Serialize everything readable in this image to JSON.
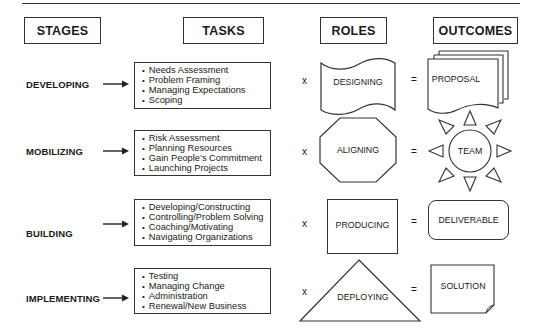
{
  "headers": {
    "stages": "STAGES",
    "tasks": "TASKS",
    "roles": "ROLES",
    "outcomes": "OUTCOMES"
  },
  "rows": [
    {
      "stage": "DEVELOPING",
      "tasks": [
        "Needs Assessment",
        "Problem Framing",
        "Managing Expectations",
        "Scoping"
      ],
      "operator_times": "x",
      "role": "DESIGNING",
      "role_shape": "banner-icon",
      "operator_equals": "=",
      "outcome": "PROPOSAL",
      "outcome_shape": "stacked-documents-icon"
    },
    {
      "stage": "MOBILIZING",
      "tasks": [
        "Risk Assessment",
        "Planning Resources",
        "Gain People’s Commitment",
        "Launching Projects"
      ],
      "operator_times": "x",
      "role": "ALIGNING",
      "role_shape": "octagon-icon",
      "operator_equals": "=",
      "outcome": "TEAM",
      "outcome_shape": "sun-icon"
    },
    {
      "stage": "BUILDING",
      "tasks": [
        "Developing/Constructing",
        "Controlling/Problem Solving",
        "Coaching/Motivating",
        "Navigating Organizations"
      ],
      "operator_times": "x",
      "role": "PRODUCING",
      "role_shape": "square-icon",
      "operator_equals": "=",
      "outcome": "DELIVERABLE",
      "outcome_shape": "rounded-rectangle-icon"
    },
    {
      "stage": "IMPLEMENTING",
      "tasks": [
        "Testing",
        "Managing Change",
        "Administration",
        "Renewal/New Business"
      ],
      "operator_times": "x",
      "role": "DEPLOYING",
      "role_shape": "triangle-icon",
      "operator_equals": "=",
      "outcome": "SOLUTION",
      "outcome_shape": "page-curl-icon"
    }
  ],
  "colors": {
    "line": "#333333",
    "text": "#1a1a1a",
    "background": "#ffffff"
  }
}
